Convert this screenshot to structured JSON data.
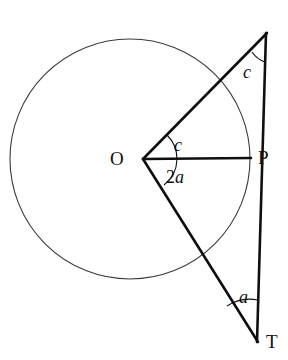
{
  "figure": {
    "type": "geometry-diagram",
    "background_color": "#ffffff",
    "stroke_color": "#100f0f",
    "circle_stroke_color": "#3a3a3a",
    "width": 288,
    "height": 360
  },
  "circle": {
    "name": "main-circle",
    "center_x": 130,
    "center_y": 159,
    "radius": 120,
    "stroke_width": 1.1
  },
  "points": {
    "O": {
      "label": "O",
      "x": 143,
      "y": 159,
      "label_x": 110,
      "label_y": 149
    },
    "P": {
      "label": "P",
      "x": 250,
      "y": 158,
      "label_x": 258,
      "label_y": 148
    },
    "T": {
      "label": "T",
      "x": 258,
      "y": 342,
      "label_x": 266,
      "label_y": 332
    },
    "A": {
      "label": "",
      "x": 267,
      "y": 33,
      "label_x": 0,
      "label_y": 0
    }
  },
  "segments": [
    {
      "name": "segment-O-to-apex",
      "x1": 143,
      "y1": 159,
      "x2": 267,
      "y2": 33,
      "stroke_width": 2.6
    },
    {
      "name": "segment-O-to-P",
      "x1": 143,
      "y1": 159,
      "x2": 251,
      "y2": 158,
      "stroke_width": 2.6
    },
    {
      "name": "segment-O-to-T",
      "x1": 143,
      "y1": 159,
      "x2": 258,
      "y2": 342,
      "stroke_width": 2.6
    },
    {
      "name": "segment-apex-to-T",
      "x1": 266,
      "y1": 33,
      "x2": 257,
      "y2": 342,
      "stroke_width": 2.6
    }
  ],
  "angle_arcs": [
    {
      "name": "arc-angle-c-at-apex",
      "d": "M 252 52 A 26 26 0 0 0 265 62",
      "stroke_width": 1.1
    },
    {
      "name": "arc-angle-c-at-center",
      "d": "M 167 135 A 34 34 0 0 1 177 159",
      "stroke_width": 1.1
    },
    {
      "name": "arc-angle-2a-at-center",
      "d": "M 177 159 A 34 34 0 0 1 164 185",
      "stroke_width": 1.1
    },
    {
      "name": "arc-angle-a-at-T",
      "d": "M 227 306 A 42 42 0 0 1 258 300",
      "stroke_width": 1.1
    }
  ],
  "angle_labels": {
    "c_apex": {
      "text": "c",
      "x": 243,
      "y": 63
    },
    "c_center": {
      "text": "c",
      "x": 174,
      "y": 136
    },
    "two_a_center": {
      "num": "2",
      "var": "a",
      "x": 166,
      "y": 168
    },
    "a_at_T": {
      "text": "a",
      "x": 239,
      "y": 288
    }
  }
}
